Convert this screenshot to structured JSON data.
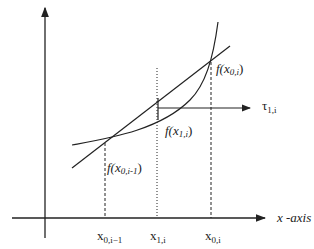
{
  "diagram": {
    "labels": {
      "f_x0i": {
        "main": "f(x",
        "sub": "0,i",
        "close": ")"
      },
      "f_x1i": {
        "main": "f(x",
        "sub": "1,i",
        "close": ")"
      },
      "f_x0im1": {
        "main": "f(x",
        "sub": "0,i-1",
        "close": ")"
      },
      "tau": {
        "main": "τ",
        "sub": "1,i"
      },
      "x0im1": {
        "main": "x",
        "sub": "0,i−1"
      },
      "x1i": {
        "main": "x",
        "sub": "1,i"
      },
      "x0i": {
        "main": "x",
        "sub": "0,i"
      },
      "xaxis": "x -axis"
    },
    "colors": {
      "stroke": "#222222"
    }
  }
}
